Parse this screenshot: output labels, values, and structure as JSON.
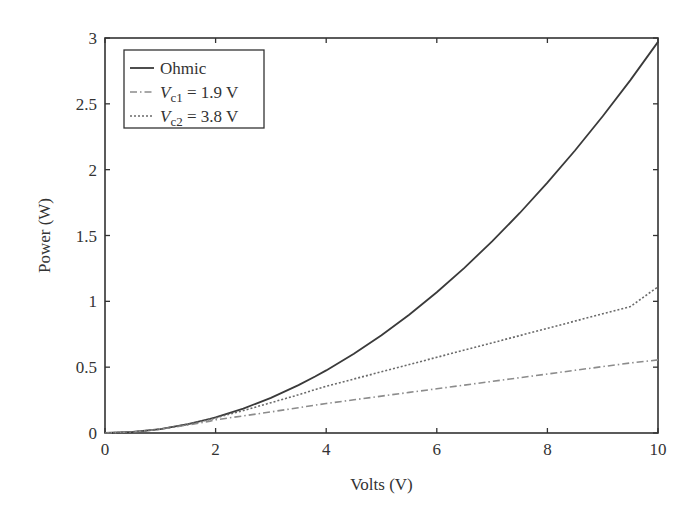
{
  "chart_data": {
    "type": "line",
    "title": "",
    "xlabel": "Volts (V)",
    "ylabel": "Power (W)",
    "xlim": [
      0,
      10
    ],
    "ylim": [
      0,
      3
    ],
    "xticks": [
      0,
      2,
      4,
      6,
      8,
      10
    ],
    "xtick_labels": [
      "0",
      "2",
      "4",
      "6",
      "8",
      "10"
    ],
    "yticks": [
      0,
      0.5,
      1,
      1.5,
      2,
      2.5,
      3
    ],
    "ytick_labels": [
      "0",
      "0.5",
      "1",
      "1.5",
      "2",
      "2.5",
      "3"
    ],
    "grid": false,
    "legend_position": "top-left",
    "x": [
      0,
      0.5,
      1,
      1.5,
      1.9,
      2,
      2.5,
      3,
      3.5,
      3.8,
      4,
      4.5,
      5,
      5.5,
      6,
      6.5,
      7,
      7.5,
      8,
      8.5,
      9,
      9.5,
      10
    ],
    "series": [
      {
        "name": "Ohmic",
        "legend": {
          "main": "Ohmic",
          "sub": "",
          "suffix": ""
        },
        "style": "solid",
        "color": "#3a3a3a",
        "values": [
          0,
          0.0074,
          0.0297,
          0.0668,
          0.1072,
          0.1188,
          0.1856,
          0.2673,
          0.3638,
          0.4288,
          0.4752,
          0.6014,
          0.7425,
          0.8984,
          1.0692,
          1.2548,
          1.4553,
          1.6706,
          1.9008,
          2.1458,
          2.4057,
          2.6804,
          2.97
        ]
      },
      {
        "name": "Vc1 = 1.9 V",
        "legend": {
          "main": "V",
          "sub": "c1",
          "suffix": " = 1.9 V"
        },
        "style": "dashdot",
        "color": "#8c8c8c",
        "values": [
          0,
          0.0074,
          0.029,
          0.061,
          0.09,
          0.1,
          0.13,
          0.16,
          0.192,
          0.212,
          0.224,
          0.252,
          0.28,
          0.308,
          0.336,
          0.364,
          0.392,
          0.42,
          0.448,
          0.476,
          0.504,
          0.532,
          0.555
        ]
      },
      {
        "name": "Vc2 = 3.8 V",
        "legend": {
          "main": "V",
          "sub": "c2",
          "suffix": " = 3.8 V"
        },
        "style": "dotted",
        "color": "#6a6a6a",
        "values": [
          0,
          0.0074,
          0.0296,
          0.066,
          0.104,
          0.115,
          0.17,
          0.23,
          0.29,
          0.33,
          0.355,
          0.41,
          0.465,
          0.52,
          0.575,
          0.63,
          0.685,
          0.74,
          0.795,
          0.85,
          0.905,
          0.96,
          1.11
        ]
      }
    ]
  }
}
